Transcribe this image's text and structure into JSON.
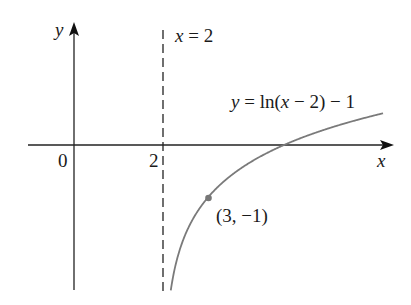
{
  "chart_data": {
    "type": "line",
    "title": "",
    "function": "y = ln(x - 2) - 1",
    "xlabel": "x",
    "ylabel": "y",
    "origin_label": "0",
    "x_tick_labels": [
      "2"
    ],
    "asymptote": {
      "label": "x = 2",
      "x": 2,
      "style": "dashed"
    },
    "point": {
      "x": 3,
      "y": -1,
      "label": "(3, −1)"
    },
    "x_intercept": 4.718,
    "series": [
      {
        "name": "y = ln(x − 2) − 1",
        "color": "#777777",
        "x": [
          2.18,
          2.3,
          2.5,
          3,
          3.5,
          4,
          4.718,
          5.5,
          6.94
        ],
        "y": [
          -2.71,
          -2.2,
          -1.69,
          -1,
          -0.59,
          -0.31,
          0,
          0.25,
          0.6
        ]
      }
    ],
    "xlim": [
      -1.0,
      7.2
    ],
    "ylim": [
      -2.75,
      2.3
    ],
    "grid": false
  },
  "labels": {
    "y_axis": "y",
    "x_axis": "x",
    "origin": "0",
    "two": "2",
    "asymptote_x": "x",
    "asymptote_eq": " = 2",
    "curve_y": "y",
    "curve_eq_a": " = ln(",
    "curve_x": "x",
    "curve_eq_b": " − 2) − 1",
    "point": "(3, −1)"
  }
}
